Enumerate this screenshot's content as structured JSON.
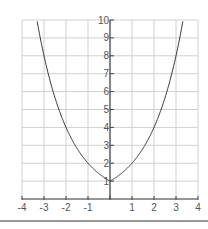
{
  "chart_data": {
    "type": "line",
    "title": "",
    "xlabel": "",
    "ylabel": "",
    "function": "y = 2^|x|",
    "xlim": [
      -4,
      4
    ],
    "ylim": [
      0,
      10
    ],
    "grid": true,
    "x_ticks": [
      "-4",
      "-3",
      "-2",
      "-1",
      "",
      "1",
      "2",
      "3",
      "4"
    ],
    "y_ticks": [
      "1",
      "2",
      "3",
      "4",
      "5",
      "6",
      "7",
      "8",
      "9",
      "10"
    ],
    "series": [
      {
        "name": "curve",
        "x": [
          -3.32,
          -3,
          -2.5,
          -2,
          -1.5,
          -1,
          -0.5,
          0,
          0.5,
          1,
          1.5,
          2,
          2.5,
          3,
          3.32
        ],
        "y": [
          10,
          8,
          5.66,
          4,
          2.83,
          2,
          1.41,
          1,
          1.41,
          2,
          2.83,
          4,
          5.66,
          8,
          10
        ]
      }
    ],
    "colors": {
      "grid": "#d0d0d0",
      "axis": "#444444",
      "curve": "#333333",
      "tick_label": "#555555",
      "baseline_rule": "#333333"
    }
  }
}
